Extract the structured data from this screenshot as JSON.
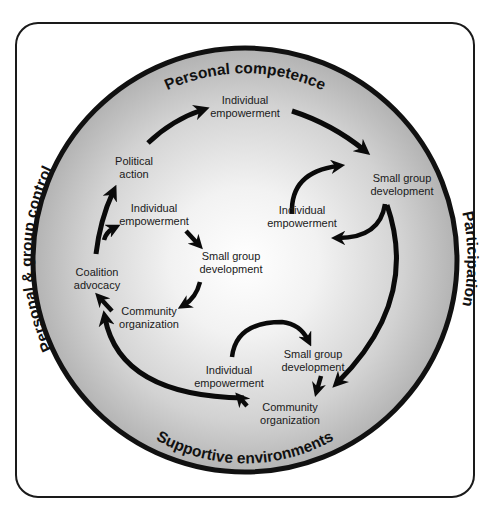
{
  "diagram": {
    "ring_labels": {
      "top": "Personal competence",
      "right": "Participation",
      "bottom": "Supportive environments",
      "left": "Personal & group control"
    },
    "nodes": {
      "outer_individual_empowerment": [
        "Individual",
        "empowerment"
      ],
      "outer_small_group_development": [
        "Small group",
        "development"
      ],
      "outer_community_organization": [
        "Community",
        "organization"
      ],
      "outer_coalition_advocacy": [
        "Coalition",
        "advocacy"
      ],
      "outer_political_action": [
        "Political",
        "action"
      ],
      "right_individual_empowerment": [
        "Individual",
        "empowerment"
      ],
      "left_individual_empowerment": [
        "Individual",
        "empowerment"
      ],
      "left_small_group_development": [
        "Small group",
        "development"
      ],
      "left_community_organization": [
        "Community",
        "organization"
      ],
      "bottom_individual_empowerment": [
        "Individual",
        "empowerment"
      ],
      "bottom_small_group_development": [
        "Small group",
        "development"
      ]
    },
    "flows": [
      {
        "from": "Political action",
        "to": "Individual empowerment",
        "cycle": "outer"
      },
      {
        "from": "Individual empowerment",
        "to": "Small group development",
        "cycle": "outer"
      },
      {
        "from": "Small group development",
        "to": "Community organization",
        "cycle": "outer"
      },
      {
        "from": "Community organization",
        "to": "Coalition advocacy",
        "cycle": "outer"
      },
      {
        "from": "Coalition advocacy",
        "to": "Political action",
        "cycle": "outer"
      },
      {
        "from": "Small group development",
        "to": "Individual empowerment",
        "cycle": "right"
      },
      {
        "from": "Individual empowerment",
        "to": "Small group development",
        "cycle": "right"
      },
      {
        "from": "Coalition advocacy",
        "to": "Individual empowerment",
        "cycle": "left"
      },
      {
        "from": "Individual empowerment",
        "to": "Small group development",
        "cycle": "left"
      },
      {
        "from": "Small group development",
        "to": "Community organization",
        "cycle": "left"
      },
      {
        "from": "Community organization",
        "to": "Coalition advocacy",
        "cycle": "left"
      },
      {
        "from": "Individual empowerment",
        "to": "Small group development",
        "cycle": "bottom"
      },
      {
        "from": "Small group development",
        "to": "Community organization",
        "cycle": "bottom"
      },
      {
        "from": "Community organization",
        "to": "Individual empowerment",
        "cycle": "bottom"
      }
    ],
    "colors": {
      "ring": "#111111",
      "arrow": "#0a0a0a",
      "fill_center": "#ffffff",
      "fill_edge": "#b8b8b8",
      "frame": "#1a1a1a"
    }
  }
}
